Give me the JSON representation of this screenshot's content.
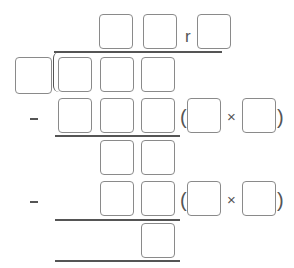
{
  "problem": {
    "type": "long-division-template",
    "remainder_label": "r",
    "times_symbol": "×",
    "minus_symbol": "–",
    "open_paren": "(",
    "close_paren": ")",
    "quotient_boxes": 2,
    "remainder_boxes": 1,
    "divisor_boxes": 1,
    "dividend_boxes": 3,
    "steps": [
      {
        "product_boxes": 3,
        "factor_boxes": 2
      },
      {
        "bring_down_boxes": 2,
        "product_boxes": 2,
        "factor_boxes": 2
      }
    ],
    "final_remainder_boxes": 1
  },
  "colors": {
    "box_border": "#8a8a8a",
    "line": "#555555",
    "text": "#555555"
  }
}
